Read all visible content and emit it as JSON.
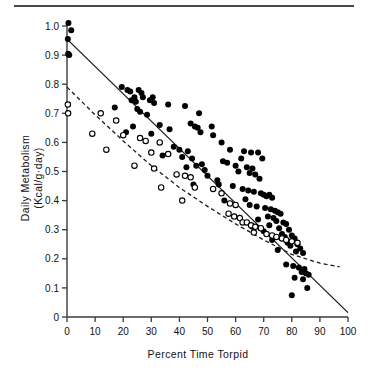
{
  "chart_data": {
    "type": "scatter",
    "title": "",
    "xlabel": "Percent Time Torpid",
    "ylabel_line1": "Daily  Metabolism",
    "ylabel_line2": "(Kcal/g·day)",
    "xlim": [
      0,
      100
    ],
    "ylim": [
      0,
      1.0
    ],
    "xticks": [
      0,
      10,
      20,
      30,
      40,
      50,
      60,
      70,
      80,
      90,
      100
    ],
    "xtick_labels": [
      "0",
      "10",
      "20",
      "30",
      "40",
      "50",
      "60",
      "70",
      "80",
      "90",
      "100"
    ],
    "yticks": [
      0,
      0.1,
      0.2,
      0.3,
      0.4,
      0.5,
      0.6,
      0.7,
      0.8,
      0.9,
      1.0
    ],
    "ytick_labels": [
      "0",
      "0.1",
      "0.2",
      "0.3",
      "0.4",
      "0.5",
      "0.6",
      "0.7",
      "0.8",
      "0.9",
      "1.0"
    ],
    "grid": false,
    "legend": "none",
    "series": [
      {
        "name": "filled-circles",
        "marker": "filled-circle",
        "color": "#000000",
        "points": [
          [
            0.5,
            1.01
          ],
          [
            1.5,
            0.985
          ],
          [
            0.3,
            0.955
          ],
          [
            0.4,
            0.905
          ],
          [
            0.8,
            0.9
          ],
          [
            19.5,
            0.79
          ],
          [
            21.5,
            0.78
          ],
          [
            22.5,
            0.775
          ],
          [
            24.0,
            0.755
          ],
          [
            25.5,
            0.78
          ],
          [
            26.5,
            0.77
          ],
          [
            27.0,
            0.755
          ],
          [
            23.0,
            0.745
          ],
          [
            24.5,
            0.74
          ],
          [
            29.5,
            0.745
          ],
          [
            30.5,
            0.755
          ],
          [
            31.0,
            0.735
          ],
          [
            17.0,
            0.72
          ],
          [
            36.0,
            0.73
          ],
          [
            42.0,
            0.725
          ],
          [
            25.0,
            0.715
          ],
          [
            26.0,
            0.705
          ],
          [
            47.0,
            0.7
          ],
          [
            28.5,
            0.695
          ],
          [
            23.5,
            0.655
          ],
          [
            33.0,
            0.66
          ],
          [
            44.0,
            0.665
          ],
          [
            45.5,
            0.655
          ],
          [
            46.5,
            0.65
          ],
          [
            51.5,
            0.655
          ],
          [
            36.5,
            0.645
          ],
          [
            47.5,
            0.635
          ],
          [
            30.0,
            0.63
          ],
          [
            52.0,
            0.625
          ],
          [
            21.0,
            0.635
          ],
          [
            55.0,
            0.6
          ],
          [
            38.0,
            0.585
          ],
          [
            40.0,
            0.575
          ],
          [
            43.0,
            0.57
          ],
          [
            58.0,
            0.575
          ],
          [
            63.0,
            0.57
          ],
          [
            65.5,
            0.565
          ],
          [
            68.0,
            0.565
          ],
          [
            34.0,
            0.555
          ],
          [
            41.0,
            0.55
          ],
          [
            44.5,
            0.545
          ],
          [
            62.0,
            0.545
          ],
          [
            69.5,
            0.545
          ],
          [
            55.5,
            0.535
          ],
          [
            57.0,
            0.53
          ],
          [
            42.5,
            0.515
          ],
          [
            46.0,
            0.52
          ],
          [
            48.0,
            0.525
          ],
          [
            60.0,
            0.52
          ],
          [
            64.0,
            0.515
          ],
          [
            66.0,
            0.51
          ],
          [
            49.0,
            0.505
          ],
          [
            61.0,
            0.5
          ],
          [
            65.0,
            0.495
          ],
          [
            67.0,
            0.49
          ],
          [
            50.0,
            0.485
          ],
          [
            53.5,
            0.47
          ],
          [
            68.5,
            0.475
          ],
          [
            45.0,
            0.455
          ],
          [
            54.0,
            0.455
          ],
          [
            59.0,
            0.45
          ],
          [
            62.5,
            0.44
          ],
          [
            64.5,
            0.435
          ],
          [
            66.5,
            0.43
          ],
          [
            69.0,
            0.425
          ],
          [
            70.0,
            0.42
          ],
          [
            71.0,
            0.415
          ],
          [
            72.0,
            0.42
          ],
          [
            73.0,
            0.41
          ],
          [
            63.5,
            0.405
          ],
          [
            56.0,
            0.4
          ],
          [
            65.0,
            0.385
          ],
          [
            67.5,
            0.38
          ],
          [
            70.5,
            0.375
          ],
          [
            72.5,
            0.37
          ],
          [
            74.0,
            0.365
          ],
          [
            75.0,
            0.36
          ],
          [
            76.0,
            0.355
          ],
          [
            71.5,
            0.345
          ],
          [
            73.5,
            0.34
          ],
          [
            68.0,
            0.335
          ],
          [
            74.5,
            0.33
          ],
          [
            77.0,
            0.325
          ],
          [
            78.0,
            0.32
          ],
          [
            72.0,
            0.315
          ],
          [
            66.0,
            0.31
          ],
          [
            75.5,
            0.305
          ],
          [
            79.0,
            0.3
          ],
          [
            70.0,
            0.295
          ],
          [
            76.5,
            0.285
          ],
          [
            80.0,
            0.28
          ],
          [
            77.5,
            0.275
          ],
          [
            81.0,
            0.27
          ],
          [
            73.0,
            0.265
          ],
          [
            78.5,
            0.255
          ],
          [
            82.0,
            0.25
          ],
          [
            79.5,
            0.245
          ],
          [
            83.0,
            0.235
          ],
          [
            75.0,
            0.23
          ],
          [
            81.5,
            0.225
          ],
          [
            84.0,
            0.22
          ],
          [
            78.0,
            0.18
          ],
          [
            80.5,
            0.175
          ],
          [
            82.5,
            0.17
          ],
          [
            84.5,
            0.165
          ],
          [
            83.5,
            0.155
          ],
          [
            85.0,
            0.15
          ],
          [
            86.0,
            0.145
          ],
          [
            81.0,
            0.135
          ],
          [
            84.0,
            0.13
          ],
          [
            85.5,
            0.1
          ],
          [
            80.0,
            0.075
          ]
        ]
      },
      {
        "name": "open-circles",
        "marker": "open-circle",
        "color": "#000000",
        "points": [
          [
            0.3,
            0.73
          ],
          [
            0.4,
            0.7
          ],
          [
            12.0,
            0.7
          ],
          [
            17.5,
            0.675
          ],
          [
            9.0,
            0.63
          ],
          [
            20.0,
            0.625
          ],
          [
            26.0,
            0.615
          ],
          [
            28.0,
            0.605
          ],
          [
            33.0,
            0.6
          ],
          [
            14.0,
            0.575
          ],
          [
            30.0,
            0.565
          ],
          [
            36.0,
            0.56
          ],
          [
            24.0,
            0.52
          ],
          [
            31.0,
            0.51
          ],
          [
            39.0,
            0.49
          ],
          [
            42.0,
            0.485
          ],
          [
            44.0,
            0.48
          ],
          [
            33.5,
            0.445
          ],
          [
            45.5,
            0.445
          ],
          [
            52.0,
            0.44
          ],
          [
            55.0,
            0.425
          ],
          [
            41.0,
            0.4
          ],
          [
            58.0,
            0.39
          ],
          [
            60.0,
            0.385
          ],
          [
            57.5,
            0.355
          ],
          [
            59.5,
            0.345
          ],
          [
            61.5,
            0.34
          ],
          [
            62.5,
            0.325
          ],
          [
            64.0,
            0.325
          ],
          [
            65.5,
            0.315
          ],
          [
            67.0,
            0.31
          ],
          [
            69.0,
            0.305
          ],
          [
            66.5,
            0.29
          ],
          [
            71.0,
            0.285
          ],
          [
            73.0,
            0.28
          ],
          [
            74.5,
            0.275
          ],
          [
            76.5,
            0.27
          ],
          [
            78.0,
            0.265
          ],
          [
            80.0,
            0.26
          ],
          [
            82.0,
            0.255
          ]
        ]
      }
    ],
    "fit_lines": [
      {
        "name": "solid-regression-line",
        "style": "solid",
        "color": "#1a1a1a",
        "x0": 0,
        "y0": 0.955,
        "x1": 100,
        "y1": 0.015
      },
      {
        "name": "dashed-regression-curve",
        "style": "dashed",
        "color": "#1a1a1a",
        "points": [
          [
            0,
            0.79
          ],
          [
            10,
            0.695
          ],
          [
            20,
            0.605
          ],
          [
            30,
            0.52
          ],
          [
            40,
            0.445
          ],
          [
            50,
            0.38
          ],
          [
            60,
            0.32
          ],
          [
            70,
            0.265
          ],
          [
            80,
            0.215
          ],
          [
            90,
            0.185
          ],
          [
            97,
            0.172
          ]
        ]
      }
    ]
  }
}
